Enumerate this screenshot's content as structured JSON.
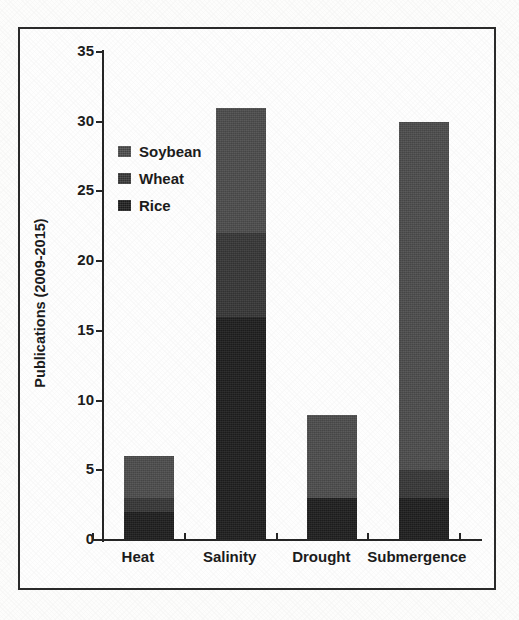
{
  "figure": {
    "frame_border_color": "#2b2b2b",
    "background_color": "#fdfdfc"
  },
  "chart_data": {
    "type": "bar",
    "subtype": "stacked-vertical",
    "title": "",
    "xlabel": "",
    "ylabel": "Publications (2009-2015)",
    "ylim": [
      0,
      35
    ],
    "ytick_step": 5,
    "yticks": [
      0,
      5,
      10,
      15,
      20,
      25,
      30,
      35
    ],
    "ytick_labels": [
      "0",
      "5",
      "10",
      "15",
      "20",
      "25",
      "30",
      "35"
    ],
    "grid": false,
    "legend_position": "upper-left-inside",
    "categories": [
      "Heat",
      "Salinity",
      "Drought",
      "Submergence"
    ],
    "series": [
      {
        "name": "Soybean",
        "color": "#4d4d4d",
        "values": [
          3,
          9,
          6,
          25
        ]
      },
      {
        "name": "Wheat",
        "color": "#383838",
        "values": [
          1,
          6,
          0,
          2
        ]
      },
      {
        "name": "Rice",
        "color": "#1f1f1f",
        "values": [
          2,
          16,
          3,
          3
        ]
      }
    ],
    "stack_order_bottom_to_top": [
      "Rice",
      "Wheat",
      "Soybean"
    ],
    "totals": [
      6,
      31,
      9,
      30
    ]
  },
  "legend": {
    "entries": [
      {
        "label": "Soybean",
        "color": "#4d4d4d"
      },
      {
        "label": "Wheat",
        "color": "#383838"
      },
      {
        "label": "Rice",
        "color": "#1f1f1f"
      }
    ]
  },
  "axes": {
    "y_title": "Publications (2009-2015)",
    "y_tick_labels": [
      "35",
      "30",
      "25",
      "20",
      "15",
      "10",
      "5",
      "0"
    ],
    "x_tick_labels": [
      "Heat",
      "Salinity",
      "Drought",
      "Submergence"
    ]
  }
}
